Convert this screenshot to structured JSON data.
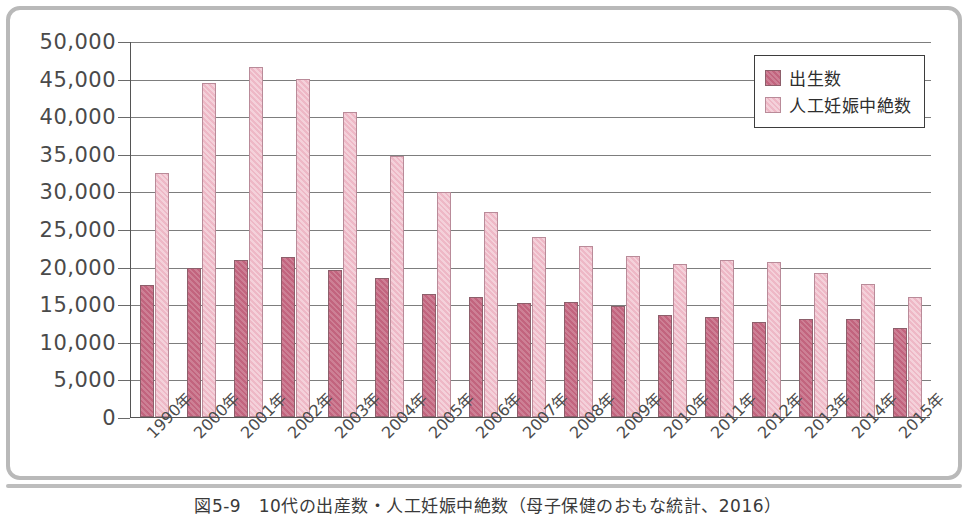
{
  "caption": "図5-9　10代の出産数・人工妊娠中絶数（母子保健のおもな統計、2016）",
  "legend": {
    "position": "top-right",
    "items": [
      {
        "label": "出生数",
        "color": "#c2647e",
        "key": "births"
      },
      {
        "label": "人工妊娠中絶数",
        "color": "#eeb8c6",
        "key": "abortions"
      }
    ]
  },
  "chart_data": {
    "type": "bar",
    "title": "10代の出産数・人工妊娠中絶数",
    "xlabel": "",
    "ylabel": "",
    "ylim": [
      0,
      50000
    ],
    "ytick_step": 5000,
    "grid": true,
    "legend_position": "top-right",
    "categories": [
      "1990年",
      "2000年",
      "2001年",
      "2002年",
      "2003年",
      "2004年",
      "2005年",
      "2006年",
      "2007年",
      "2008年",
      "2009年",
      "2010年",
      "2011年",
      "2012年",
      "2013年",
      "2014年",
      "2015年"
    ],
    "ytick_labels": [
      "50,000",
      "45,000",
      "40,000",
      "35,000",
      "30,000",
      "25,000",
      "20,000",
      "15,000",
      "10,000",
      "5,000",
      "0"
    ],
    "ytick_values": [
      50000,
      45000,
      40000,
      35000,
      30000,
      25000,
      20000,
      15000,
      10000,
      5000,
      0
    ],
    "series": [
      {
        "name": "出生数",
        "color": "#c2647e",
        "values": [
          17500,
          19800,
          20900,
          21300,
          19500,
          18500,
          16400,
          15900,
          15100,
          15300,
          14700,
          13500,
          13300,
          12700,
          13000,
          13000,
          11800
        ]
      },
      {
        "name": "人工妊娠中絶数",
        "color": "#eeb8c6",
        "values": [
          32400,
          44400,
          46500,
          44900,
          40500,
          34700,
          29900,
          27300,
          23900,
          22700,
          21400,
          20300,
          20900,
          20600,
          19200,
          17700,
          16000
        ]
      }
    ]
  }
}
